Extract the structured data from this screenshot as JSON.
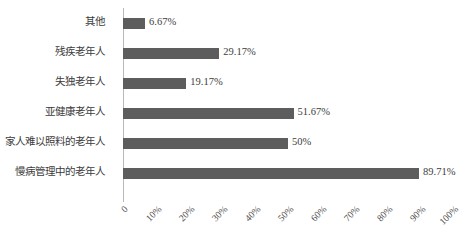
{
  "chart_data": {
    "type": "bar",
    "orientation": "horizontal",
    "title": "",
    "xlabel": "",
    "ylabel": "",
    "xlim": [
      0,
      100
    ],
    "grid": false,
    "legend": false,
    "bar_color": "#5d5d5d",
    "axis_color": "#b9b9b9",
    "categories": [
      "其他",
      "残疾老年人",
      "失独老年人",
      "亚健康老年人",
      "家人难以照料的老年人",
      "慢病管理中的老年人"
    ],
    "values": [
      6.67,
      29.17,
      19.17,
      51.67,
      50,
      89.71
    ],
    "value_labels": [
      "6.67%",
      "29.17%",
      "19.17%",
      "51.67%",
      "50%",
      "89.71%"
    ],
    "xticks": [
      0,
      10,
      20,
      30,
      40,
      50,
      60,
      70,
      80,
      90,
      100
    ],
    "xtick_labels": [
      "0",
      "10%",
      "20%",
      "30%",
      "40%",
      "50%",
      "60%",
      "70%",
      "80%",
      "90%",
      "100%"
    ]
  }
}
